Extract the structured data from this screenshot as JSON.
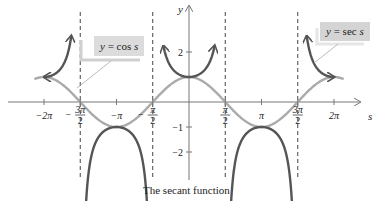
{
  "chart_data": {
    "type": "line",
    "title": "The secant function",
    "xlabel": "s",
    "ylabel": "y",
    "x_range": [
      -6.9,
      7.4
    ],
    "y_range": [
      -3.0,
      3.2
    ],
    "x_ticks": [
      {
        "value": -6.2832,
        "label": "−2π"
      },
      {
        "value": -4.7124,
        "label": "−3π/2",
        "num": "3π",
        "den": "2",
        "neg": true
      },
      {
        "value": -3.1416,
        "label": "−π"
      },
      {
        "value": -1.5708,
        "label": "−π/2",
        "num": "π",
        "den": "2",
        "neg": true
      },
      {
        "value": 1.5708,
        "label": "π/2",
        "num": "π",
        "den": "2",
        "neg": false
      },
      {
        "value": 3.1416,
        "label": "π"
      },
      {
        "value": 4.7124,
        "label": "3π/2",
        "num": "3π",
        "den": "2",
        "neg": false
      },
      {
        "value": 6.2832,
        "label": "2π"
      }
    ],
    "y_ticks": [
      {
        "value": 2,
        "label": "2"
      },
      {
        "value": -1,
        "label": "−1"
      },
      {
        "value": -2,
        "label": "−2"
      }
    ],
    "asymptotes": [
      -4.7124,
      -1.5708,
      1.5708,
      4.7124
    ],
    "series": [
      {
        "name": "y = cos s",
        "color": "#aaaaaa",
        "domain": [
          -6.7,
          6.7
        ],
        "function": "cos"
      },
      {
        "name": "y = sec s",
        "color": "#555555",
        "function": "sec",
        "branches": [
          [
            -6.283,
            -5.1
          ],
          [
            -4.55,
            -1.73
          ],
          [
            -1.11,
            1.11
          ],
          [
            1.73,
            4.55
          ],
          [
            5.1,
            6.283
          ]
        ]
      }
    ],
    "annotations": [
      {
        "text": "y = cos s",
        "points_to": "cos curve near s = -4.8"
      },
      {
        "text": "y = sec s",
        "points_to": "sec curve near s = 5.2"
      }
    ],
    "grid": false,
    "legend": "callout labels"
  },
  "labels": {
    "cos_label_y": "y",
    "cos_label_eq": " = cos ",
    "cos_label_s": "s",
    "sec_label_y": "y",
    "sec_label_eq": " = sec ",
    "sec_label_s": "s",
    "x_axis_var": "s",
    "y_axis_var": "y",
    "caption": "The secant function"
  },
  "colors": {
    "cos": "#aaaaaa",
    "sec": "#555555",
    "axis": "#777777",
    "asymptote": "#444444",
    "label_box": "#dcdcdc",
    "label_shadow": "#f2f2f2"
  }
}
